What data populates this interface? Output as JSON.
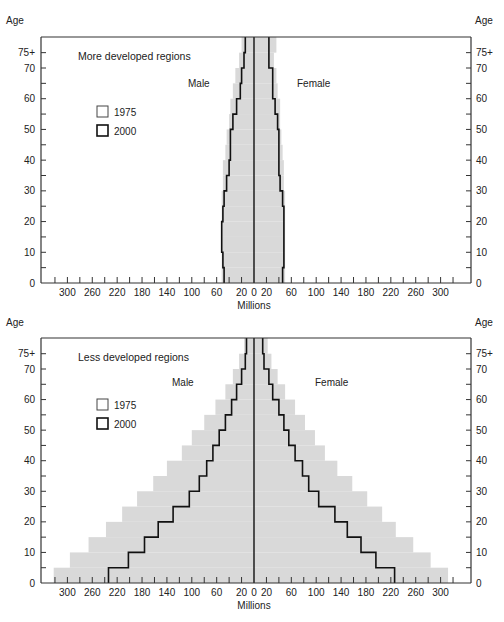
{
  "chart_data": [
    {
      "type": "bar",
      "subtype": "population-pyramid",
      "title": "More developed regions",
      "xlabel": "Millions",
      "ylabel": "Age",
      "left_label": "Male",
      "right_label": "Female",
      "legend": [
        {
          "label": "1975",
          "style": "outline"
        },
        {
          "label": "2000",
          "style": "shaded"
        }
      ],
      "x_ticks": [
        300,
        260,
        220,
        180,
        140,
        100,
        60,
        20,
        0,
        20,
        60,
        100,
        140,
        180,
        220,
        260,
        300
      ],
      "y_ticks": [
        "0",
        "10",
        "20",
        "30",
        "40",
        "50",
        "60",
        "70",
        "75+"
      ],
      "xlim": [
        -340,
        340
      ],
      "age_groups": [
        "0-4",
        "5-9",
        "10-14",
        "15-19",
        "20-24",
        "25-29",
        "30-34",
        "35-39",
        "40-44",
        "45-49",
        "50-54",
        "55-59",
        "60-64",
        "65-69",
        "70-74",
        "75+"
      ],
      "series": [
        {
          "name": "1975 Male",
          "values": [
            48,
            50,
            52,
            52,
            50,
            48,
            44,
            40,
            38,
            38,
            34,
            28,
            22,
            20,
            16,
            14
          ]
        },
        {
          "name": "1975 Female",
          "values": [
            46,
            48,
            48,
            48,
            48,
            46,
            42,
            40,
            40,
            40,
            38,
            34,
            30,
            30,
            24,
            24
          ]
        },
        {
          "name": "2000 Male",
          "values": [
            52,
            52,
            52,
            52,
            52,
            52,
            50,
            50,
            46,
            44,
            40,
            38,
            34,
            30,
            24,
            20
          ]
        },
        {
          "name": "2000 Female",
          "values": [
            50,
            50,
            50,
            50,
            50,
            50,
            48,
            48,
            46,
            44,
            42,
            42,
            38,
            36,
            32,
            36
          ]
        }
      ]
    },
    {
      "type": "bar",
      "subtype": "population-pyramid",
      "title": "Less developed regions",
      "xlabel": "Millions",
      "ylabel": "Age",
      "left_label": "Male",
      "right_label": "Female",
      "legend": [
        {
          "label": "1975",
          "style": "outline"
        },
        {
          "label": "2000",
          "style": "shaded"
        }
      ],
      "x_ticks": [
        300,
        260,
        220,
        180,
        140,
        100,
        60,
        20,
        0,
        20,
        60,
        100,
        140,
        180,
        220,
        260,
        300
      ],
      "y_ticks": [
        "0",
        "10",
        "20",
        "30",
        "40",
        "50",
        "60",
        "70",
        "75+"
      ],
      "xlim": [
        -340,
        340
      ],
      "age_groups": [
        "0-4",
        "5-9",
        "10-14",
        "15-19",
        "20-24",
        "25-29",
        "30-34",
        "35-39",
        "40-44",
        "45-49",
        "50-54",
        "55-59",
        "60-64",
        "65-69",
        "70-74",
        "75+"
      ],
      "series": [
        {
          "name": "1975 Male",
          "values": [
            234,
            202,
            176,
            154,
            130,
            104,
            88,
            76,
            66,
            56,
            46,
            36,
            28,
            20,
            14,
            12
          ]
        },
        {
          "name": "1975 Female",
          "values": [
            226,
            196,
            172,
            150,
            130,
            104,
            88,
            78,
            66,
            56,
            48,
            40,
            30,
            24,
            16,
            14
          ]
        },
        {
          "name": "2000 Male",
          "values": [
            322,
            296,
            266,
            238,
            212,
            188,
            162,
            140,
            116,
            100,
            80,
            62,
            46,
            34,
            24,
            16
          ]
        },
        {
          "name": "2000 Female",
          "values": [
            312,
            284,
            256,
            228,
            206,
            182,
            158,
            134,
            114,
            98,
            82,
            66,
            50,
            38,
            28,
            22
          ]
        }
      ]
    }
  ],
  "labels": {
    "age": "Age",
    "millions": "Millions",
    "male": "Male",
    "female": "Female",
    "legend_1975": "1975",
    "legend_2000": "2000",
    "top_title": "More developed regions",
    "bottom_title": "Less developed regions"
  }
}
